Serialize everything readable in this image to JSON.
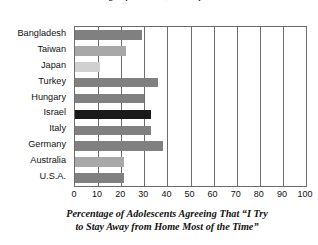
{
  "figure": {
    "top_title_partial": "Percentage of the Time, Most of the Time”",
    "axis_caption_line1": "Percentage of Adolescents Agreeing That “I Try",
    "axis_caption_line2": "to Stay Away from Home Most of the Time”"
  },
  "colors": {
    "bar_dark": "#1a1a1a",
    "bar_medium": "#808080",
    "bar_light": "#a8a8a8",
    "bar_lightest": "#d0d0d0",
    "axis": "#6b6b6b",
    "text": "#111111",
    "background": "#ffffff"
  },
  "chart_data": {
    "type": "bar",
    "orientation": "horizontal",
    "title": "Percentage of Adolescents Agreeing That “I Try to Stay Away from Home Most of the Time”",
    "xlabel": "Percentage of Adolescents Agreeing That “I Try to Stay Away from Home Most of the Time”",
    "ylabel": "",
    "xlim": [
      0,
      100
    ],
    "xticks": [
      0,
      10,
      20,
      30,
      40,
      50,
      60,
      70,
      80,
      90,
      100
    ],
    "xtick_labels": [
      "0",
      "10",
      "20",
      "30",
      "40",
      "50",
      "60",
      "70",
      "80",
      "90",
      "100"
    ],
    "grid": "vertical",
    "legend": "none",
    "categories": [
      "Bangladesh",
      "Taiwan",
      "Japan",
      "Turkey",
      "Hungary",
      "Israel",
      "Italy",
      "Germany",
      "Australia",
      "U.S.A."
    ],
    "values": [
      29,
      22,
      11,
      36,
      30,
      33,
      33,
      38,
      21,
      21
    ],
    "bars": [
      {
        "label": "Bangladesh",
        "value": 29,
        "color": "#808080"
      },
      {
        "label": "Taiwan",
        "value": 22,
        "color": "#a8a8a8"
      },
      {
        "label": "Japan",
        "value": 11,
        "color": "#d0d0d0"
      },
      {
        "label": "Turkey",
        "value": 36,
        "color": "#808080"
      },
      {
        "label": "Hungary",
        "value": 30,
        "color": "#808080"
      },
      {
        "label": "Israel",
        "value": 33,
        "color": "#1a1a1a"
      },
      {
        "label": "Italy",
        "value": 33,
        "color": "#808080"
      },
      {
        "label": "Germany",
        "value": 38,
        "color": "#808080"
      },
      {
        "label": "Australia",
        "value": 21,
        "color": "#a8a8a8"
      },
      {
        "label": "U.S.A.",
        "value": 21,
        "color": "#808080"
      }
    ]
  }
}
